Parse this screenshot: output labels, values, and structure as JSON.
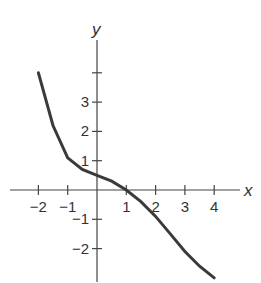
{
  "chart_data": {
    "type": "line",
    "title": "",
    "xlabel": "x",
    "ylabel": "y",
    "xlim": [
      -2.5,
      5
    ],
    "ylim": [
      -3,
      5
    ],
    "x_ticks": [
      -2,
      -1,
      1,
      2,
      3,
      4
    ],
    "x_tick_labels": [
      "−2",
      "−1",
      "1",
      "2",
      "3",
      "4"
    ],
    "y_ticks": [
      -2,
      -1,
      1,
      2,
      3,
      4
    ],
    "y_tick_labels": [
      "−2",
      "−1",
      "1",
      "2",
      "3",
      ""
    ],
    "grid": false,
    "series": [
      {
        "name": "f(x)",
        "x": [
          -2,
          -1.5,
          -1,
          -0.5,
          0,
          0.5,
          1,
          1.5,
          2,
          2.5,
          3,
          3.5,
          4
        ],
        "y": [
          4,
          2.2,
          1.1,
          0.7,
          0.5,
          0.3,
          0,
          -0.4,
          -0.9,
          -1.5,
          -2.1,
          -2.6,
          -3
        ]
      }
    ]
  }
}
